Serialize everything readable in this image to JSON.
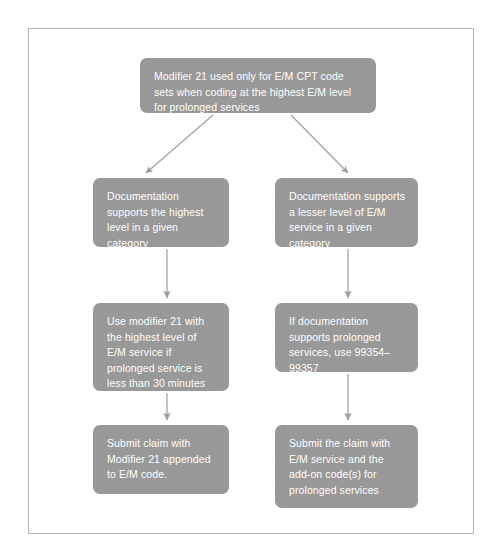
{
  "diagram": {
    "title_text": "Modifier 21 decision flowchart",
    "node_fill_color": "#9a9a9a",
    "node_text_color": "#ffffff",
    "connector_color": "#9d9d9d",
    "frame_border_color": "#b5b5b5",
    "page_background_color": "#ffffff",
    "nodes": [
      {
        "id": "root",
        "text": "Modifier 21 used only for E/M CPT code sets when coding at the highest E/M level for prolonged services"
      },
      {
        "id": "left-1",
        "text": "Documentation supports the highest level in a given category"
      },
      {
        "id": "right-1",
        "text": "Documentation supports a lesser level of E/M service in a given category"
      },
      {
        "id": "left-2",
        "text": "Use modifier 21 with the highest level of E/M service if prolonged service is less than 30 minutes"
      },
      {
        "id": "right-2",
        "text": "If documentation supports prolonged services, use 99354–99357"
      },
      {
        "id": "left-3",
        "text": "Submit claim with Modifier 21 appended to E/M code."
      },
      {
        "id": "right-3",
        "text": "Submit the claim with E/M service and the add-on code(s) for prolonged services"
      }
    ],
    "connectors": [
      {
        "id": "root-to-left-1",
        "from": "root",
        "to": "left-1",
        "style": "diagonal-arrow"
      },
      {
        "id": "root-to-right-1",
        "from": "root",
        "to": "right-1",
        "style": "diagonal-arrow"
      },
      {
        "id": "left-1-to-left-2",
        "from": "left-1",
        "to": "left-2",
        "style": "vertical-arrow"
      },
      {
        "id": "right-1-to-right-2",
        "from": "right-1",
        "to": "right-2",
        "style": "vertical-arrow"
      },
      {
        "id": "left-2-to-left-3",
        "from": "left-2",
        "to": "left-3",
        "style": "vertical-arrow"
      },
      {
        "id": "right-2-to-right-3",
        "from": "right-2",
        "to": "right-3",
        "style": "vertical-arrow"
      }
    ]
  }
}
